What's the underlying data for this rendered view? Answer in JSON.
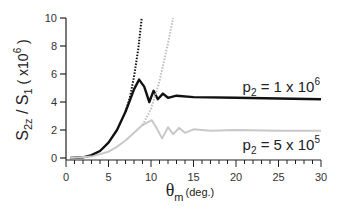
{
  "chart_data": {
    "type": "line",
    "title": "",
    "xlabel": "θm (deg.)",
    "xlabel_main": "θ",
    "xlabel_sub": "m",
    "xlabel_unit": "(deg.)",
    "ylabel": "S2z / S1 ( x10^6 )",
    "xlim": [
      0,
      30
    ],
    "ylim": [
      0,
      10
    ],
    "x_ticks": [
      0,
      5,
      10,
      15,
      20,
      25,
      30
    ],
    "y_ticks": [
      0,
      2,
      4,
      6,
      8,
      10
    ],
    "grid": false,
    "legend_position": "inline annotations at right",
    "series": [
      {
        "name": "p2 = 1 x 10^6",
        "label_main": "p",
        "label_sub": "2",
        "label_rest": " = 1 x 10",
        "label_sup": "6",
        "color": "#111111",
        "style": "solid",
        "x": [
          0.5,
          2,
          3,
          4,
          5,
          6,
          7,
          7.5,
          8,
          8.6,
          9.2,
          9.8,
          10.3,
          10.8,
          11.4,
          12,
          13,
          15,
          20,
          25,
          30
        ],
        "y": [
          0,
          0.05,
          0.2,
          0.5,
          1.1,
          2.0,
          3.3,
          4.1,
          4.9,
          5.6,
          5.1,
          4.0,
          4.8,
          4.2,
          4.6,
          4.3,
          4.45,
          4.35,
          4.3,
          4.25,
          4.2
        ]
      },
      {
        "name": "p2 = 1 x 10^6 (asymptote)",
        "color": "#111111",
        "style": "dotted",
        "x": [
          7,
          7.5,
          8,
          8.5,
          8.9
        ],
        "y": [
          3.3,
          4.3,
          5.8,
          7.8,
          10
        ]
      },
      {
        "name": "p2 = 5 x 10^5",
        "label_main": "p",
        "label_sub": "2",
        "label_rest": " = 5 x 10",
        "label_sup": "5",
        "color": "#c8c8c8",
        "style": "solid",
        "x": [
          0.5,
          3,
          5,
          6,
          7,
          8,
          9,
          10.1,
          10.7,
          11.3,
          12,
          12.6,
          13.3,
          14,
          15,
          17,
          20,
          25,
          30
        ],
        "y": [
          0,
          0.1,
          0.45,
          0.8,
          1.25,
          1.8,
          2.35,
          2.7,
          2.1,
          1.4,
          2.2,
          1.7,
          2.15,
          1.8,
          2.05,
          1.95,
          2.0,
          1.95,
          1.95
        ]
      },
      {
        "name": "p2 = 5 x 10^5 (asymptote)",
        "color": "#bdbdbd",
        "style": "dotted",
        "x": [
          9,
          10,
          11,
          12,
          12.6
        ],
        "y": [
          2.35,
          3.5,
          5.5,
          8.2,
          10
        ]
      }
    ]
  }
}
